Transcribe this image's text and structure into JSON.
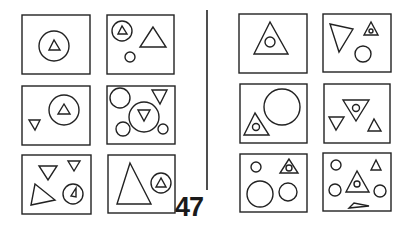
{
  "page": {
    "page_number": "47",
    "divider": {
      "x": 207,
      "y1": 10,
      "y2": 190
    }
  },
  "panels": [
    {
      "id": "left-r1c1",
      "group": "left",
      "box": [
        22,
        15,
        68,
        59
      ],
      "shapes": [
        {
          "type": "circle",
          "cx": 54,
          "cy": 46,
          "r": 15
        },
        {
          "type": "triangle",
          "points": "54,40 49,50 60,50"
        }
      ]
    },
    {
      "id": "left-r1c2",
      "group": "left",
      "box": [
        107,
        15,
        67,
        59
      ],
      "shapes": [
        {
          "type": "circle",
          "cx": 122,
          "cy": 31,
          "r": 10
        },
        {
          "type": "triangle",
          "points": "122,26 118,34 127,34"
        },
        {
          "type": "triangle",
          "points": "153,27 140,47 166,47"
        },
        {
          "type": "circle",
          "cx": 130,
          "cy": 57,
          "r": 5
        }
      ]
    },
    {
      "id": "left-r2c1",
      "group": "left",
      "box": [
        22,
        86,
        68,
        59
      ],
      "shapes": [
        {
          "type": "circle",
          "cx": 64,
          "cy": 110,
          "r": 15
        },
        {
          "type": "triangle",
          "points": "64,104 58,114 70,114"
        },
        {
          "type": "triangle",
          "points": "29,120 40,120 35,130"
        }
      ]
    },
    {
      "id": "left-r2c2",
      "group": "left",
      "box": [
        107,
        86,
        68,
        58
      ],
      "shapes": [
        {
          "type": "circle",
          "cx": 120,
          "cy": 98,
          "r": 10
        },
        {
          "type": "triangle",
          "points": "152,90 167,90 160,104"
        },
        {
          "type": "circle",
          "cx": 144,
          "cy": 117,
          "r": 15
        },
        {
          "type": "triangle",
          "points": "138,110 150,110 144,121"
        },
        {
          "type": "circle",
          "cx": 123,
          "cy": 129,
          "r": 7
        },
        {
          "type": "circle",
          "cx": 163,
          "cy": 129,
          "r": 5
        }
      ]
    },
    {
      "id": "left-r3c1",
      "group": "left",
      "box": [
        22,
        155,
        69,
        59
      ],
      "shapes": [
        {
          "type": "triangle",
          "points": "39,166 57,166 48,180"
        },
        {
          "type": "triangle",
          "points": "68,161 80,161 74,171"
        },
        {
          "type": "triangle",
          "points": "35,184 55,200 31,205"
        },
        {
          "type": "circle",
          "cx": 73,
          "cy": 194,
          "r": 10
        },
        {
          "type": "triangle",
          "points": "76,188 71,196 76,197"
        }
      ]
    },
    {
      "id": "left-r3c2",
      "group": "left",
      "box": [
        108,
        155,
        67,
        58
      ],
      "shapes": [
        {
          "type": "triangle",
          "points": "130,163 117,204 151,204"
        },
        {
          "type": "circle",
          "cx": 161,
          "cy": 183,
          "r": 10
        },
        {
          "type": "triangle",
          "points": "161,178 156,187 166,187"
        }
      ]
    },
    {
      "id": "right-r1c1",
      "group": "right",
      "box": [
        239,
        14,
        68,
        59
      ],
      "shapes": [
        {
          "type": "triangle",
          "points": "270,22 254,54 288,54"
        },
        {
          "type": "circle",
          "cx": 270,
          "cy": 42,
          "r": 5
        }
      ]
    },
    {
      "id": "right-r1c2",
      "group": "right",
      "box": [
        323,
        14,
        68,
        58
      ],
      "shapes": [
        {
          "type": "triangle",
          "points": "330,24 353,29 339,52"
        },
        {
          "type": "triangle",
          "points": "371,22 364,35 378,35"
        },
        {
          "type": "circle",
          "cx": 371,
          "cy": 31,
          "r": 2
        },
        {
          "type": "circle",
          "cx": 363,
          "cy": 54,
          "r": 8
        }
      ]
    },
    {
      "id": "right-r2c1",
      "group": "right",
      "box": [
        240,
        84,
        67,
        59
      ],
      "shapes": [
        {
          "type": "circle",
          "cx": 282,
          "cy": 107,
          "r": 18
        },
        {
          "type": "triangle",
          "points": "255,113 244,135 269,135"
        },
        {
          "type": "circle",
          "cx": 256,
          "cy": 127,
          "r": 3.5
        }
      ]
    },
    {
      "id": "right-r2c2",
      "group": "right",
      "box": [
        324,
        84,
        66,
        59
      ],
      "shapes": [
        {
          "type": "triangle",
          "points": "343,100 369,100 356,121"
        },
        {
          "type": "circle",
          "cx": 356,
          "cy": 108,
          "r": 3.5
        },
        {
          "type": "triangle",
          "points": "329,117 344,117 336,130"
        },
        {
          "type": "triangle",
          "points": "368,131 381,131 374,119"
        }
      ]
    },
    {
      "id": "right-r3c1",
      "group": "right",
      "box": [
        240,
        154,
        67,
        58
      ],
      "shapes": [
        {
          "type": "circle",
          "cx": 256,
          "cy": 167,
          "r": 5
        },
        {
          "type": "triangle",
          "points": "289,159 280,173 298,173"
        },
        {
          "type": "circle",
          "cx": 289,
          "cy": 168,
          "r": 3
        },
        {
          "type": "circle",
          "cx": 260,
          "cy": 194,
          "r": 13
        },
        {
          "type": "circle",
          "cx": 288,
          "cy": 192,
          "r": 9
        }
      ]
    },
    {
      "id": "right-r3c2",
      "group": "right",
      "box": [
        323,
        153,
        68,
        58
      ],
      "shapes": [
        {
          "type": "circle",
          "cx": 336,
          "cy": 165,
          "r": 5
        },
        {
          "type": "triangle",
          "points": "376,160 371,170 381,170"
        },
        {
          "type": "triangle",
          "points": "357,171 346,192 369,192"
        },
        {
          "type": "circle",
          "cx": 357,
          "cy": 184,
          "r": 3
        },
        {
          "type": "circle",
          "cx": 335,
          "cy": 190,
          "r": 6
        },
        {
          "type": "circle",
          "cx": 380,
          "cy": 191,
          "r": 6
        },
        {
          "type": "triangle",
          "points": "354,203 349,208 369,206"
        }
      ]
    }
  ]
}
